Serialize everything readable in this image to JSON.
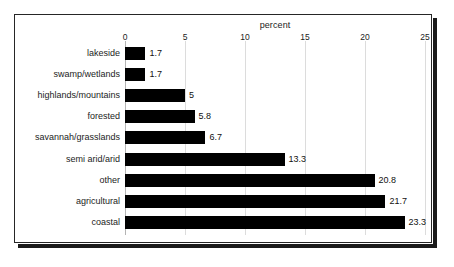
{
  "chart_data": {
    "type": "bar",
    "orientation": "horizontal",
    "title": "percent",
    "xlabel": "percent",
    "ylabel": "",
    "xlim": [
      0,
      25
    ],
    "xticks": [
      0,
      5,
      10,
      15,
      20,
      25
    ],
    "xtick_labels": [
      "0",
      "5",
      "10",
      "15",
      "20",
      "25"
    ],
    "grid": true,
    "grid_axis": "x",
    "legend": false,
    "bar_color": "#000000",
    "categories": [
      "lakeside",
      "swamp/wetlands",
      "highlands/mountains",
      "forested",
      "savannah/grasslands",
      "semi arid/arid",
      "other",
      "agricultural",
      "coastal"
    ],
    "values": [
      1.7,
      1.7,
      5,
      5.8,
      6.7,
      13.3,
      20.8,
      21.7,
      23.3
    ],
    "value_labels": [
      "1.7",
      "1.7",
      "5",
      "5.8",
      "6.7",
      "13.3",
      "20.8",
      "21.7",
      "23.3"
    ]
  }
}
